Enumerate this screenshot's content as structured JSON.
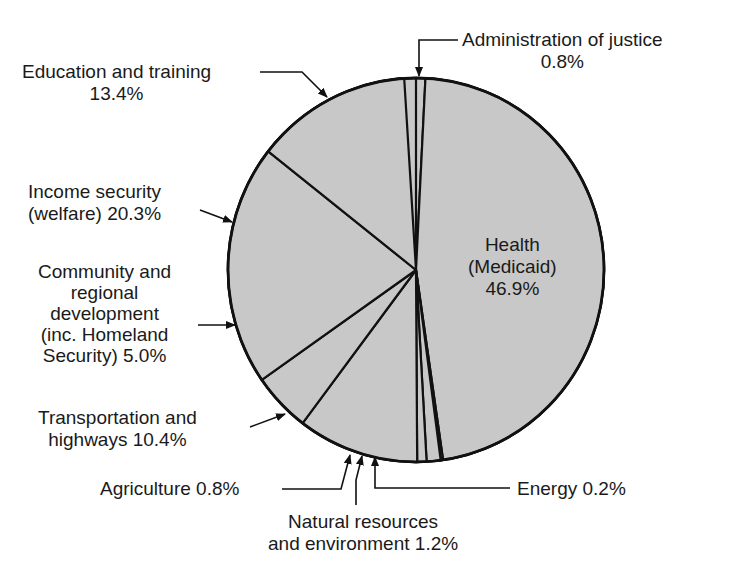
{
  "chart_data": {
    "type": "pie",
    "title": "",
    "start_angle_deg": 0,
    "direction": "clockwise",
    "fill_color": "#c8c8c8",
    "stroke_color": "#111111",
    "slices": [
      {
        "label": "Administration of justice",
        "value": 0.8
      },
      {
        "label": "Health (Medicaid)",
        "value": 46.9
      },
      {
        "label": "Energy",
        "value": 0.2
      },
      {
        "label": "Natural resources and environment",
        "value": 1.2
      },
      {
        "label": "Agriculture",
        "value": 0.8
      },
      {
        "label": "Transportation and highways",
        "value": 10.4
      },
      {
        "label": "Community and regional development (inc. Homeland Security)",
        "value": 5.0
      },
      {
        "label": "Income security (welfare)",
        "value": 20.3
      },
      {
        "label": "Education and training",
        "value": 13.4
      }
    ]
  },
  "labels": {
    "admin": {
      "line1": "Administration of justice",
      "line2": "0.8%"
    },
    "health": {
      "line1": "Health",
      "line2": "(Medicaid)",
      "line3": "46.9%"
    },
    "energy": {
      "line1": "Energy 0.2%"
    },
    "natural": {
      "line1": "Natural resources",
      "line2": "and environment 1.2%"
    },
    "agriculture": {
      "line1": "Agriculture 0.8%"
    },
    "transport": {
      "line1": "Transportation and",
      "line2": "highways 10.4%"
    },
    "community": {
      "line1": "Community and",
      "line2": "regional",
      "line3": "development",
      "line4": "(inc. Homeland",
      "line5": "Security) 5.0%"
    },
    "income": {
      "line1": "Income security",
      "line2": "(welfare) 20.3%"
    },
    "education": {
      "line1": "Education and training",
      "line2": "13.4%"
    }
  }
}
